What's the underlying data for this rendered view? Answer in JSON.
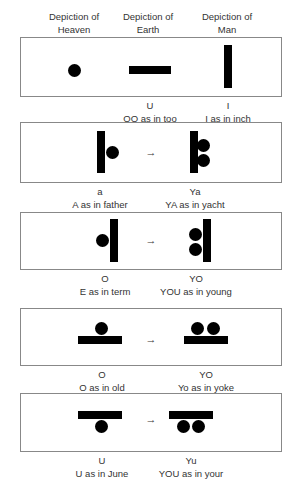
{
  "headers": {
    "heaven": {
      "line1": "Depiction of",
      "line2": "Heaven"
    },
    "earth": {
      "line1": "Depiction of",
      "line2": "Earth"
    },
    "man": {
      "line1": "Depiction of",
      "line2": "Man"
    }
  },
  "arrow_glyph": "→",
  "rows": [
    {
      "captions": [
        {
          "letter": "U",
          "sound": "OO as in too"
        },
        {
          "letter": "I",
          "sound": "I as in inch"
        }
      ]
    },
    {
      "captions": [
        {
          "letter": "a",
          "sound": "A as in father"
        },
        {
          "letter": "Ya",
          "sound": "YA as in yacht"
        }
      ]
    },
    {
      "captions": [
        {
          "letter": "O",
          "sound": "E as in term"
        },
        {
          "letter": "YO",
          "sound": "YOU as in young"
        }
      ]
    },
    {
      "captions": [
        {
          "letter": "O",
          "sound": "O as in old"
        },
        {
          "letter": "YO",
          "sound": "Yo as in yoke"
        }
      ]
    },
    {
      "captions": [
        {
          "letter": "U",
          "sound": "U as in June"
        },
        {
          "letter": "Yu",
          "sound": "YOU as in your"
        }
      ]
    }
  ]
}
